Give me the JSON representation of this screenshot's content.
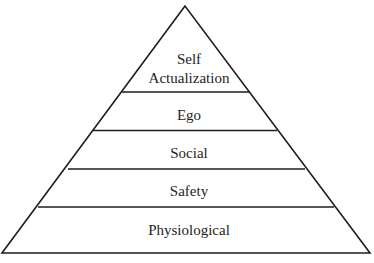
{
  "diagram": {
    "title": "",
    "type": "pyramid",
    "levels": [
      {
        "id": "self-actualization",
        "line1": "Self",
        "line2": "Actualization"
      },
      {
        "id": "ego",
        "label": "Ego"
      },
      {
        "id": "social",
        "label": "Social"
      },
      {
        "id": "safety",
        "label": "Safety"
      },
      {
        "id": "physiological",
        "label": "Physiological"
      }
    ],
    "colors": {
      "stroke": "#1e1e1e",
      "fill": "#ffffff",
      "text": "#1e1e1e"
    }
  }
}
